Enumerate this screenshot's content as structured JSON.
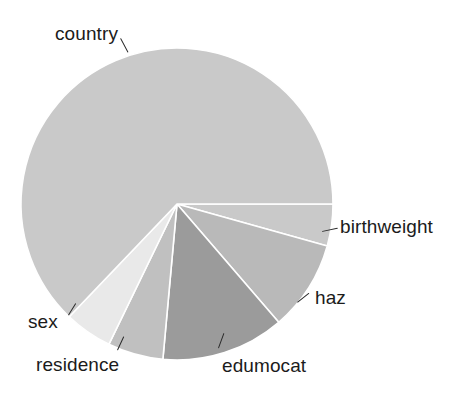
{
  "chart_data": {
    "type": "pie",
    "title": "",
    "subtitle": "",
    "xlabel": "",
    "ylabel": "",
    "legend_position": "none",
    "grid": false,
    "labels_placement": "outside-with-leader-lines",
    "start_angle_deg": 0,
    "direction": "clockwise",
    "categories": [
      "birthweight",
      "haz",
      "edumocat",
      "residence",
      "sex",
      "country"
    ],
    "values": [
      4.3,
      9.4,
      12.8,
      5.8,
      4.9,
      62.8
    ],
    "unit": "percent",
    "slices": [
      {
        "label": "birthweight",
        "value": 4.3,
        "start_angle_deg": 0.0,
        "end_angle_deg": 15.6,
        "color": "#c9c9c9"
      },
      {
        "label": "haz",
        "value": 9.4,
        "start_angle_deg": 15.6,
        "end_angle_deg": 49.3,
        "color": "#b9b9b9"
      },
      {
        "label": "edumocat",
        "value": 12.8,
        "start_angle_deg": 49.3,
        "end_angle_deg": 95.2,
        "color": "#9b9b9b"
      },
      {
        "label": "residence",
        "value": 5.8,
        "start_angle_deg": 95.2,
        "end_angle_deg": 115.9,
        "color": "#c0c0c0"
      },
      {
        "label": "sex",
        "value": 4.9,
        "start_angle_deg": 115.9,
        "end_angle_deg": 133.7,
        "color": "#e9e9e9"
      },
      {
        "label": "country",
        "value": 62.8,
        "start_angle_deg": 133.7,
        "end_angle_deg": 360.0,
        "color": "#c9c9c9"
      }
    ],
    "geometry": {
      "center_x": 177,
      "center_y": 204,
      "radius": 156,
      "separator_color": "#ffffff",
      "separator_width": 1.6
    },
    "background_color": "#ffffff",
    "text_color": "#1b1b1b"
  },
  "labels": {
    "country": "country",
    "birthweight": "birthweight",
    "haz": "haz",
    "edumocat": "edumocat",
    "residence": "residence",
    "sex": "sex"
  }
}
